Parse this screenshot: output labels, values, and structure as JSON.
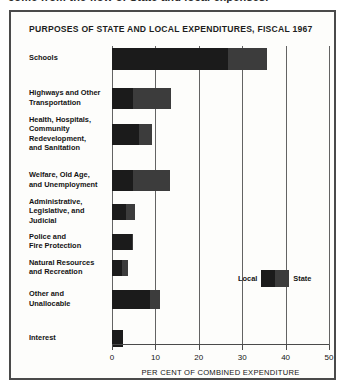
{
  "page": {
    "cut_off_caption": "come from the flow of State and local expenses."
  },
  "chart_data": {
    "type": "bar",
    "orientation": "horizontal",
    "stacked": true,
    "title": "PURPOSES OF STATE AND LOCAL EXPENDITURES, FISCAL 1967",
    "xlabel": "PER CENT OF COMBINED EXPENDITURE",
    "ylabel": "",
    "xlim": [
      0,
      50
    ],
    "xticks": [
      0,
      10,
      20,
      30,
      40,
      50
    ],
    "xtick_labels": [
      "0",
      "10",
      "20",
      "30",
      "40",
      "50"
    ],
    "grid": true,
    "grid_axis": "x",
    "legend_position": "inside-lower-right",
    "categories": [
      "Schools",
      "Highways and Other Transportation",
      "Health, Hospitals, Community Redevelopment, and Sanitation",
      "Welfare, Old Age, and Unemployment",
      "Administrative, Legislative, and Judicial",
      "Police and Fire Protection",
      "Natural Resources and Recreation",
      "Other and Unallocable",
      "Interest"
    ],
    "category_label_lines": [
      [
        "Schools"
      ],
      [
        "Highways and Other",
        "Transportation"
      ],
      [
        "Health, Hospitals,",
        "Community",
        "Redevelopment,",
        "and Sanitation"
      ],
      [
        "Welfare, Old Age,",
        "and Unemployment"
      ],
      [
        "Administrative,",
        "Legislative, and",
        "Judicial"
      ],
      [
        "Police and",
        "Fire Protection"
      ],
      [
        "Natural Resources",
        "and Recreation"
      ],
      [
        "Other and",
        "Unallocable"
      ],
      [
        "Interest"
      ]
    ],
    "series": [
      {
        "name": "Local",
        "color": "#1b1b1b",
        "values": [
          26.8,
          4.9,
          6.2,
          4.9,
          3.2,
          4.6,
          2.4,
          8.8,
          2.5
        ]
      },
      {
        "name": "State",
        "color": "#3c3c3c",
        "values": [
          9.0,
          8.6,
          3.0,
          8.4,
          2.1,
          0.3,
          1.3,
          2.3,
          0.0
        ]
      }
    ],
    "totals": [
      35.8,
      13.5,
      9.2,
      13.3,
      5.3,
      4.9,
      3.7,
      11.1,
      2.5
    ]
  },
  "legend": {
    "local_label": "Local",
    "state_label": "State"
  },
  "colors": {
    "local": "#1b1b1b",
    "state": "#3c3c3c",
    "frame": "#4a4a4a",
    "grid": "#636363",
    "background": "#fdfdfb"
  }
}
